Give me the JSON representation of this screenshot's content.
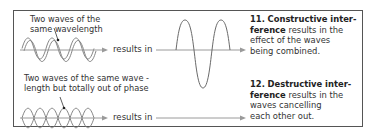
{
  "diagram": {
    "rows": [
      {
        "id": "constructive",
        "label_line1": "Two waves of the",
        "label_line2": "same wavelength",
        "results_text": "results in",
        "caption_number": "11.",
        "caption_bold_1": "Constructive inter-",
        "caption_bold_2": "ference",
        "caption_rest_2": " results in the",
        "caption_line3": "effect of the waves",
        "caption_line4": "being combined."
      },
      {
        "id": "destructive",
        "label_line1": "Two waves of the same wave -",
        "label_line2": "length but totally out of phase",
        "results_text": "results in",
        "caption_number": "12.",
        "caption_bold_1": "Destructive inter-",
        "caption_bold_2": "ference",
        "caption_rest_2": " results in the",
        "caption_line3": "waves cancelling",
        "caption_line4": "each other out."
      }
    ],
    "colors": {
      "frame": "#555555",
      "wave": "#6a6a6a",
      "axis": "#9a9a9a",
      "text": "#333333"
    }
  }
}
